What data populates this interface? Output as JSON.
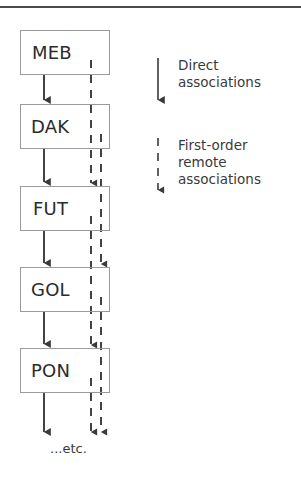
{
  "figure": {
    "type": "flow-diagram",
    "background_color": "#ffffff",
    "top_rule_color": "#4a4a4a",
    "box_border_color": "#9a9a9a",
    "arrow_color": "#3a3a3a",
    "text_color": "#2b2b2b"
  },
  "nodes": [
    {
      "id": "node-meb",
      "label": "MEB",
      "x": 20,
      "y": 30,
      "w": 90,
      "h": 45
    },
    {
      "id": "node-dak",
      "label": "DAK",
      "x": 20,
      "y": 104,
      "w": 90,
      "h": 45
    },
    {
      "id": "node-fut",
      "label": "FUT",
      "x": 20,
      "y": 186,
      "w": 90,
      "h": 45
    },
    {
      "id": "node-gol",
      "label": "GOL",
      "x": 20,
      "y": 267,
      "w": 90,
      "h": 45
    },
    {
      "id": "node-pon",
      "label": "PON",
      "x": 20,
      "y": 348,
      "w": 90,
      "h": 45
    }
  ],
  "continuation": {
    "label": "...etc."
  },
  "legend": [
    {
      "id": "legend-direct",
      "line_style": "solid",
      "label": "Direct\nassociations"
    },
    {
      "id": "legend-remote",
      "line_style": "dashed",
      "label": "First-order\nremote\nassociations"
    }
  ],
  "edges": {
    "direct": {
      "style": "solid",
      "description": "MEB→DAK, DAK→FUT, FUT→GOL, GOL→PON, PON→etc."
    },
    "remote": {
      "style": "dashed",
      "description": "MEB→FUT, DAK→GOL, FUT→PON, GOL→etc., PON→etc."
    }
  }
}
